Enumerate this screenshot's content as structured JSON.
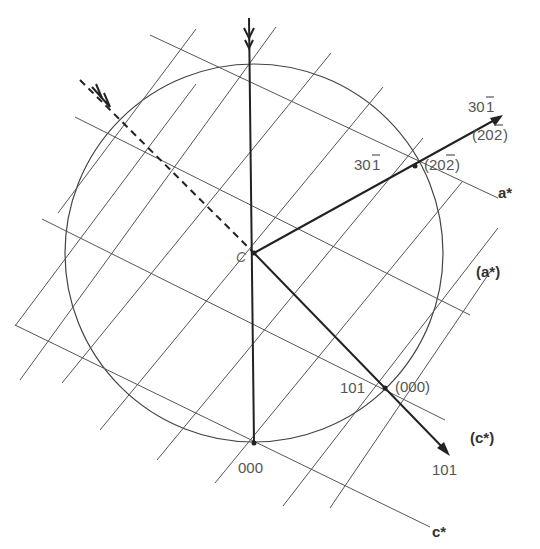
{
  "figure": {
    "center_label": "C",
    "points": {
      "origin_primary": {
        "label": "000"
      },
      "point_101": {
        "label": "101"
      },
      "origin_secondary": {
        "label": "(000)"
      },
      "point_30-1": {
        "label": "301̅",
        "display": "30",
        "bar_digit": "1"
      },
      "point_20-2": {
        "label": "(20̅2̅)",
        "display_pre": "(20",
        "bar_digit": "2",
        "display_post": ")"
      }
    },
    "arrows": {
      "beam_30-1": {
        "label_top": "30",
        "label_top_bar": "1",
        "label_bottom_pre": "(20",
        "label_bottom_bar": "2",
        "label_bottom_post": ")"
      },
      "beam_101": {
        "label": "101"
      }
    },
    "axes": {
      "a_star": {
        "label": "a*"
      },
      "a_star_secondary": {
        "label": "(a*)"
      },
      "c_star": {
        "label": "c*"
      },
      "c_star_secondary": {
        "label": "(c*)"
      }
    },
    "colors": {
      "line": "#555555",
      "heavy": "#222222",
      "text": "#555555"
    }
  }
}
